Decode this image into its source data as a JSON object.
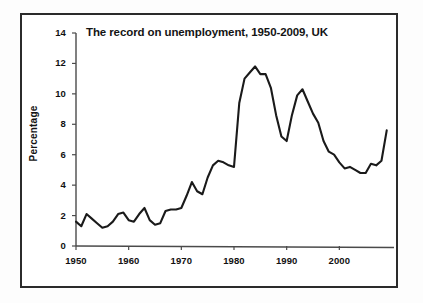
{
  "chart_data": {
    "type": "line",
    "title": "The record on unemployment, 1950-2009, UK",
    "xlabel": "",
    "ylabel": "Percentage",
    "xlim": [
      1950,
      2010
    ],
    "ylim": [
      0,
      14
    ],
    "ytick_labels": [
      "0",
      "2",
      "4",
      "6",
      "8",
      "10",
      "12",
      "14"
    ],
    "ytick_values": [
      0,
      2,
      4,
      6,
      8,
      10,
      12,
      14
    ],
    "xtick_labels": [
      "1950",
      "1960",
      "1970",
      "1980",
      "1990",
      "2000"
    ],
    "xtick_values": [
      1950,
      1960,
      1970,
      1980,
      1990,
      2000
    ],
    "grid": false,
    "legend": "none",
    "line_color": "#1a1a1a",
    "axis_color": "#444444",
    "series": [
      {
        "name": "UK unemployment rate",
        "x": [
          1950,
          1951,
          1952,
          1953,
          1954,
          1955,
          1956,
          1957,
          1958,
          1959,
          1960,
          1961,
          1962,
          1963,
          1964,
          1965,
          1966,
          1967,
          1968,
          1969,
          1970,
          1971,
          1972,
          1973,
          1974,
          1975,
          1976,
          1977,
          1978,
          1979,
          1980,
          1981,
          1982,
          1983,
          1984,
          1985,
          1986,
          1987,
          1988,
          1989,
          1990,
          1991,
          1992,
          1993,
          1994,
          1995,
          1996,
          1997,
          1998,
          1999,
          2000,
          2001,
          2002,
          2003,
          2004,
          2005,
          2006,
          2007,
          2008,
          2009
        ],
        "values": [
          1.6,
          1.3,
          2.1,
          1.8,
          1.5,
          1.2,
          1.3,
          1.6,
          2.1,
          2.2,
          1.7,
          1.6,
          2.1,
          2.5,
          1.7,
          1.4,
          1.5,
          2.3,
          2.4,
          2.4,
          2.5,
          3.3,
          4.2,
          3.6,
          3.4,
          4.5,
          5.3,
          5.6,
          5.5,
          5.3,
          5.2,
          9.4,
          11.0,
          11.4,
          11.8,
          11.3,
          11.3,
          10.4,
          8.6,
          7.2,
          6.9,
          8.6,
          9.9,
          10.3,
          9.5,
          8.7,
          8.1,
          6.9,
          6.2,
          6.0,
          5.5,
          5.1,
          5.2,
          5.0,
          4.8,
          4.8,
          5.4,
          5.3,
          5.6,
          7.6
        ]
      }
    ]
  }
}
